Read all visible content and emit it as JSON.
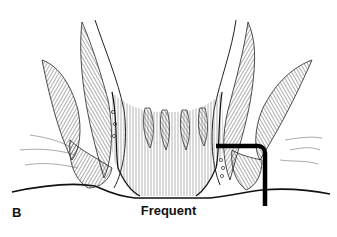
{
  "figure": {
    "panel_letter": "B",
    "caption": "Frequent",
    "annotation": "fistula tract (thick black line)",
    "colors": {
      "line": "#111111",
      "background": "#ffffff",
      "hatch": "#555555"
    }
  }
}
